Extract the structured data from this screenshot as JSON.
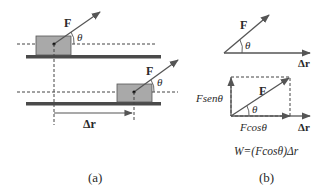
{
  "panel_a": {
    "caption": "(a)",
    "force_label_1": "F",
    "angle_label_1": "θ",
    "force_label_2": "F",
    "angle_label_2": "θ",
    "displacement_label": "Δr"
  },
  "panel_b": {
    "caption": "(b)",
    "top": {
      "force_label": "F",
      "angle_label": "θ",
      "displacement_label": "Δr"
    },
    "bottom": {
      "force_label": "F",
      "angle_label": "θ",
      "vertical_component_label": "Fsenθ",
      "horizontal_component_label": "Fcosθ",
      "displacement_label": "Δr",
      "work_formula": "W=(Fcosθ)Δr"
    }
  },
  "colors": {
    "block_fill": "#a9a9a9",
    "block_stroke": "#555555",
    "ground": "#4a4a4a",
    "arrow": "#555555",
    "text": "#2a2a2a"
  }
}
